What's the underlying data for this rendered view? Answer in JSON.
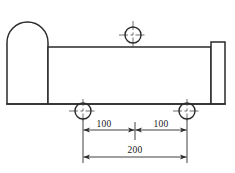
{
  "drawing": {
    "title": "Part side view with hole pattern",
    "view": "side-elevation",
    "line_color": "#2b2b2b",
    "center_mark_color": "#4a4a4a",
    "background": "#ffffff",
    "units": "mm"
  },
  "geometry": {
    "dome_end": {
      "name": "rounded-left-end",
      "left_x": 7,
      "right_x": 48,
      "top_y": 22,
      "bottom_y": 104,
      "arc_radius": 20.5
    },
    "main_body": {
      "name": "main-body",
      "left_x": 48,
      "right_x": 211,
      "top_y": 47,
      "bottom_y": 104
    },
    "right_flange": {
      "name": "right-flange",
      "left_x": 211,
      "right_x": 225,
      "top_y": 42,
      "bottom_y": 104
    }
  },
  "holes": [
    {
      "id": "hole-top",
      "label": "top-center-hole",
      "cx": 133,
      "cy": 35,
      "r": 8
    },
    {
      "id": "hole-bottom-left",
      "label": "bottom-left-hole",
      "cx": 83,
      "cy": 111,
      "r": 8
    },
    {
      "id": "hole-bottom-right",
      "label": "bottom-right-hole",
      "cx": 187,
      "cy": 111,
      "r": 8
    }
  ],
  "dimensions": {
    "chain": [
      {
        "id": "dim-100-left",
        "value": "100",
        "from_x": 83,
        "to_x": 135,
        "line_y": 130,
        "text_x": 104,
        "text_y": 127
      },
      {
        "id": "dim-100-right",
        "value": "100",
        "from_x": 135,
        "to_x": 187,
        "line_y": 130,
        "text_x": 161,
        "text_y": 127
      }
    ],
    "overall": {
      "id": "dim-200",
      "value": "200",
      "from_x": 83,
      "to_x": 187,
      "line_y": 157,
      "text_x": 135,
      "text_y": 153
    }
  }
}
